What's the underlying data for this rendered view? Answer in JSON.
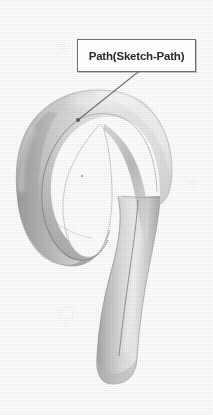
{
  "view": {
    "background_color": "#ffffff",
    "kind": "cad-3d-viewport",
    "description": "Shaded 3D swept tube forming a hook / spiral loop"
  },
  "callout": {
    "label": "Path(Sketch-Path)",
    "border_color": "#6e6e6e",
    "fill_color": "#fdfdfd",
    "text_color": "#2b2b2b",
    "box": {
      "x": 77,
      "y": 39,
      "width": 119,
      "height": 33
    },
    "leader": {
      "from_x": 138,
      "from_y": 72,
      "to_x": 78,
      "to_y": 120,
      "color": "#6b6b6b",
      "endpoint_marker": "dot"
    }
  },
  "model": {
    "name": "swept-tube-hook",
    "shading": "gouraud-grayscale",
    "surface_light": "#efefef",
    "surface_mid": "#cfcfcf",
    "surface_dark": "#a8a8a8",
    "surface_shadow": "#949494",
    "edge_color": "#8c8c8c",
    "path_curve_color": "#7a7a7a",
    "origin_marker": {
      "x": 82,
      "y": 176,
      "color": "#9a9a9a"
    },
    "bounds": {
      "left": 16,
      "top": 88,
      "right": 172,
      "bottom": 384
    },
    "features": [
      "outer-loop-torus",
      "inner-hole",
      "descending-straight-tube",
      "rounded-end-cap",
      "sketch-path-centerline"
    ]
  }
}
